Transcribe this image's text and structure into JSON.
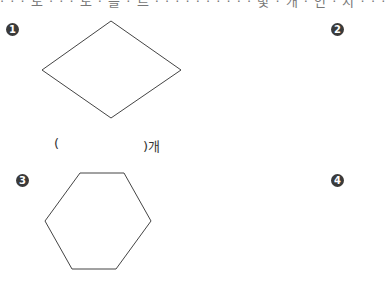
{
  "header": {
    "clipped_instruction": "· · · 도 · · · 도 · 을 · 르 · · · · · · · · · · 몇 · 개 · 인 · 지 · · ·"
  },
  "problems": [
    {
      "number": "1",
      "shape": "rhombus",
      "answer_open": "(",
      "answer_close": ")개"
    },
    {
      "number": "2",
      "shape": ""
    },
    {
      "number": "3",
      "shape": "hexagon"
    },
    {
      "number": "4",
      "shape": ""
    }
  ],
  "colors": {
    "stroke": "#444444",
    "marker_bg": "#3a3a3a"
  }
}
